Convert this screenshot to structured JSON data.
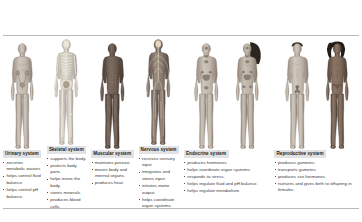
{
  "plate": {
    "systems": [
      {
        "id": "urinary",
        "heading": "Urinary system",
        "figures": [
          "female-urinary-anterior"
        ],
        "facts": [
          "excretes metabolic wastes.",
          "helps control fluid balance.",
          "helps control pH balance."
        ]
      },
      {
        "id": "skeletal",
        "heading": "Skeletal system",
        "figures": [
          "male-skeleton-anterior"
        ],
        "facts": [
          "supports the body.",
          "protects body parts.",
          "helps move the body.",
          "stores minerals.",
          "produces blood cells."
        ]
      },
      {
        "id": "muscular",
        "heading": "Muscular system",
        "figures": [
          "male-musculature-anterior"
        ],
        "facts": [
          "maintains posture.",
          "moves body and internal organs.",
          "produces heat."
        ]
      },
      {
        "id": "nervous",
        "heading": "Nervous system",
        "figures": [
          "male-nervous-anterior"
        ],
        "facts": [
          "receives sensory input.",
          "integrates and stores input.",
          "initiates motor output.",
          "helps coordinate organ systems."
        ]
      },
      {
        "id": "endocrine",
        "heading": "Endocrine system",
        "figures": [
          "male-endocrine-anterior",
          "female-endocrine-anterior"
        ],
        "facts": [
          "produces hormones.",
          "helps coordinate organ systems.",
          "responds to stress.",
          "helps regulate fluid and pH balance.",
          "helps regulate metabolism."
        ]
      },
      {
        "id": "reproductive",
        "heading": "Reproductive system",
        "figures": [
          "male-reproductive-anterior",
          "female-reproductive-anterior"
        ],
        "facts": [
          "produces gametes.",
          "transports gametes.",
          "produces sex hormones.",
          "nurtures and gives birth to offspring in females."
        ]
      }
    ],
    "colors": {
      "rule": "#b9b9bc",
      "heading_band": "#e2e2e4",
      "body_text": "#3a3a3a",
      "skin_light": "#cfc6bd",
      "skin_mid": "#b4a89c",
      "skin_dark": "#8e8075",
      "bone": "#ded9cf",
      "muscle": "#6b5a52",
      "nerve": "#f0e7cf",
      "organ_accent": "#9a8f84"
    }
  }
}
